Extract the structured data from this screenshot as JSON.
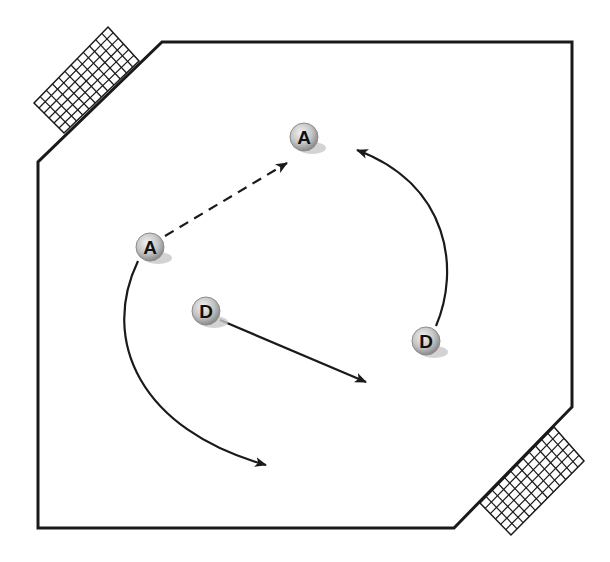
{
  "diagram": {
    "title": "",
    "colors": {
      "line": "#1a1a1a",
      "player_fill_light": "#e8e8e8",
      "player_fill_dark": "#9a9a9a",
      "shadow": "#c8c8c8"
    },
    "field": {
      "points": "162,42 572,42 572,407 454,528 38,528 38,162"
    },
    "goals": [
      {
        "id": "goal-top-left",
        "corners": [
          [
            108,
            27
          ],
          [
            139,
            61
          ],
          [
            64,
            133
          ],
          [
            34,
            103
          ]
        ]
      },
      {
        "id": "goal-bottom-right",
        "corners": [
          [
            554,
            427
          ],
          [
            584,
            461
          ],
          [
            511,
            535
          ],
          [
            480,
            503
          ]
        ]
      }
    ],
    "players": [
      {
        "id": "attacker-top",
        "label": "A",
        "x": 304,
        "y": 137
      },
      {
        "id": "attacker-left",
        "label": "A",
        "x": 150,
        "y": 247
      },
      {
        "id": "defender-center",
        "label": "D",
        "x": 206,
        "y": 311
      },
      {
        "id": "defender-right",
        "label": "D",
        "x": 426,
        "y": 341
      }
    ],
    "paths": [
      {
        "id": "pass-dashed",
        "style": "dashed",
        "d": "M 165 236 L 287 163"
      },
      {
        "id": "run-right-curve",
        "style": "solid",
        "d": "M 436 326 C 460 270, 450 185, 357 150"
      },
      {
        "id": "run-left-curve",
        "style": "solid",
        "d": "M 138 261 C 100 340, 140 430, 266 465"
      },
      {
        "id": "run-defender-straight",
        "style": "solid",
        "d": "M 220 320 L 366 382"
      }
    ]
  }
}
